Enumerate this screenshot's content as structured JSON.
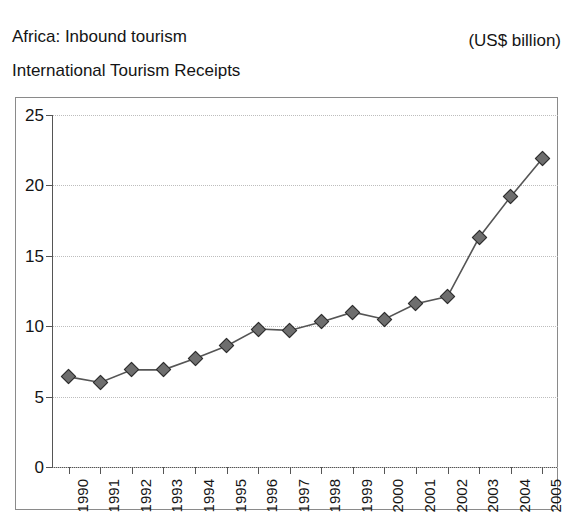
{
  "header": {
    "title": "Africa: Inbound tourism",
    "subtitle": "International Tourism Receipts",
    "units": "(US$ billion)"
  },
  "chart_data": {
    "type": "line",
    "title": "Africa: Inbound tourism",
    "subtitle": "International Tourism Receipts",
    "xlabel": "",
    "ylabel": "",
    "units": "(US$ billion)",
    "categories": [
      "1990",
      "1991",
      "1992",
      "1993",
      "1994",
      "1995",
      "1996",
      "1997",
      "1998",
      "1999",
      "2000",
      "2001",
      "2002",
      "2003",
      "2004",
      "2005"
    ],
    "values": [
      6.4,
      6.0,
      6.9,
      6.9,
      7.7,
      8.6,
      9.8,
      9.7,
      10.3,
      11.0,
      10.5,
      11.6,
      12.1,
      16.3,
      19.2,
      21.9
    ],
    "ylim": [
      0,
      25
    ],
    "yticks": [
      0,
      5,
      10,
      15,
      20,
      25
    ],
    "ytick_labels": [
      "0",
      "5",
      "10",
      "15",
      "20",
      "25"
    ],
    "grid": true,
    "grid_style": "dotted-horizontal",
    "legend": null,
    "marker": "diamond",
    "series_color": "#555555",
    "marker_fill": "#6e6e6e",
    "marker_edge": "#2b2b2b",
    "grid_color": "#bdbdbd",
    "axis_color": "#555555",
    "frame_color": "#8a8a8a",
    "background": "#ffffff"
  }
}
